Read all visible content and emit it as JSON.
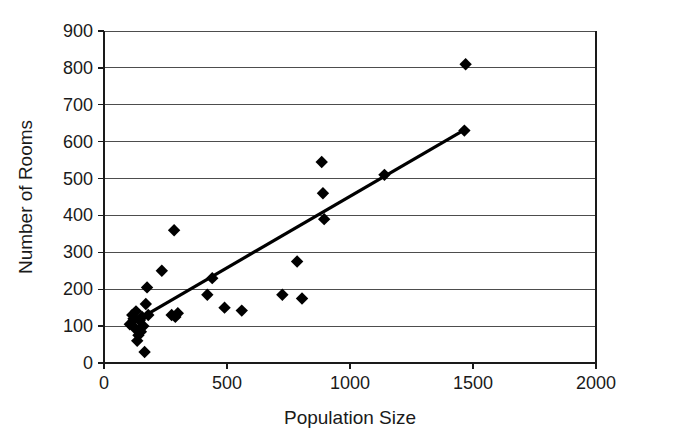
{
  "chart_data": {
    "type": "scatter",
    "title": "",
    "xlabel": "Population Size",
    "ylabel": "Number of Rooms",
    "xlim": [
      0,
      2000
    ],
    "ylim": [
      0,
      900
    ],
    "xticks": [
      0,
      500,
      1000,
      1500,
      2000
    ],
    "yticks": [
      0,
      100,
      200,
      300,
      400,
      500,
      600,
      700,
      800,
      900
    ],
    "xtick_labels": [
      "0",
      "500",
      "1000",
      "1500",
      "2000"
    ],
    "ytick_labels": [
      "0",
      "100",
      "200",
      "300",
      "400",
      "500",
      "600",
      "700",
      "800",
      "900"
    ],
    "grid": "horizontal",
    "legend": "none",
    "marker_shape": "diamond",
    "marker_color": "#000000",
    "series": [
      {
        "name": "Settlements",
        "points": [
          [
            105,
            105
          ],
          [
            115,
            130
          ],
          [
            120,
            120
          ],
          [
            125,
            95
          ],
          [
            130,
            140
          ],
          [
            135,
            60
          ],
          [
            140,
            75
          ],
          [
            145,
            115
          ],
          [
            150,
            85
          ],
          [
            155,
            125
          ],
          [
            160,
            100
          ],
          [
            165,
            30
          ],
          [
            170,
            160
          ],
          [
            175,
            205
          ],
          [
            180,
            130
          ],
          [
            235,
            250
          ],
          [
            275,
            130
          ],
          [
            285,
            360
          ],
          [
            290,
            125
          ],
          [
            300,
            135
          ],
          [
            420,
            185
          ],
          [
            440,
            230
          ],
          [
            490,
            150
          ],
          [
            560,
            142
          ],
          [
            725,
            185
          ],
          [
            785,
            275
          ],
          [
            805,
            175
          ],
          [
            885,
            545
          ],
          [
            890,
            460
          ],
          [
            895,
            390
          ],
          [
            1140,
            510
          ],
          [
            1465,
            630
          ],
          [
            1470,
            810
          ]
        ]
      }
    ],
    "trendline": {
      "type": "linear-fit",
      "x_start": 105,
      "y_start": 105,
      "x_end": 1465,
      "y_end": 632
    }
  },
  "axes": {
    "x_axis_name": "Population Size",
    "y_axis_name": "Number of Rooms"
  }
}
